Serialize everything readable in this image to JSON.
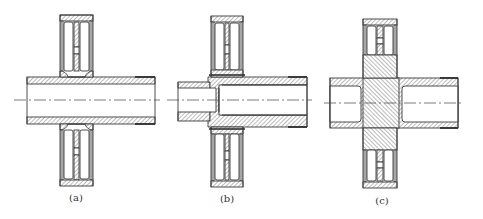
{
  "figure": {
    "panels": [
      {
        "id": "a",
        "label": "(a)",
        "description": "Gear welded onto hollow shaft (uniform bore)",
        "label_pos": {
          "x": 76,
          "y": 192
        },
        "tube": {
          "x1": 27,
          "x2": 155,
          "outer_top": 77,
          "inner_top": 84,
          "inner_bottom": 117,
          "outer_bottom": 124
        },
        "gear": {
          "x1": 60,
          "x2": 93,
          "top": 15,
          "bottom": 186
        }
      },
      {
        "id": "b",
        "label": "(b)",
        "description": "Gear on stepped hollow shaft with smaller stub",
        "label_pos": {
          "x": 227,
          "y": 193
        },
        "stub": {
          "x1": 178,
          "x2": 212,
          "outer_top": 82,
          "inner_top": 88,
          "inner_bottom": 112,
          "outer_bottom": 121
        },
        "tube": {
          "x1": 208,
          "x2": 307,
          "outer_top": 77,
          "inner_top": 85,
          "inner_bottom": 115,
          "outer_bottom": 127,
          "bore_start": 219
        },
        "gear": {
          "x1": 211,
          "x2": 243,
          "top": 16,
          "bottom": 187
        }
      },
      {
        "id": "c",
        "label": "(c)",
        "description": "Gear with solid hub between two hollow shaft sections",
        "label_pos": {
          "x": 382,
          "y": 195
        },
        "tube": {
          "x1": 330,
          "x2": 458,
          "outer_top": 78,
          "inner_top": 86,
          "inner_bottom": 122,
          "outer_bottom": 128
        },
        "solid_block": {
          "x1": 363,
          "x2": 399
        },
        "left_bore_end": 361,
        "right_bore_start": 402,
        "gear": {
          "x1": 363,
          "x2": 397,
          "top": 19,
          "bottom": 188
        }
      }
    ],
    "centerline_y": {
      "a": 100,
      "b": 100,
      "c": 103
    },
    "colors": {
      "line": "#3a3a3a",
      "background": "#ffffff"
    }
  }
}
